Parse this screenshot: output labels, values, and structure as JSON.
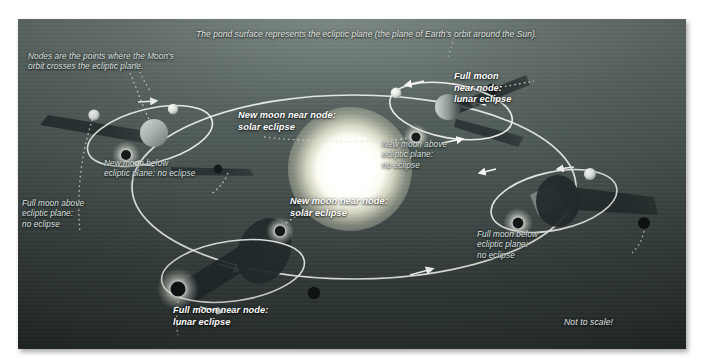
{
  "figure": {
    "not_to_scale_note": "Not to scale!",
    "top_caption": "The pond surface represents the ecliptic plane (the plane of Earth's orbit around the Sun).",
    "node_caption": "Nodes are the points where the Moon's\norbit crosses the ecliptic plane.",
    "colors": {
      "water_near": "#6e7a76",
      "water_far": "#2b3331",
      "orbit_line": "#f2f3ef",
      "dotted_guide": "#e6e8e4",
      "sun_core": "#ffffff",
      "earth_lit": "#b9c3bd",
      "earth_dark": "#1a1f1f",
      "label_text": "#e9ece9",
      "frame_border": "#ffffff"
    }
  },
  "labels": [
    {
      "id": "top-caption",
      "name": "caption-ecliptic-plane",
      "style": "caption",
      "text": "The pond surface represents the ecliptic plane (the plane of Earth's orbit around the Sun)."
    },
    {
      "id": "nodes-note",
      "name": "caption-nodes-definition",
      "style": "plain",
      "text": "Nodes are the points where the Moon's\norbit crosses the ecliptic plane."
    },
    {
      "id": "full-moon-node-lunar-top",
      "name": "label-full-moon-near-node-lunar-eclipse-top",
      "style": "bold",
      "text": "Full moon\nnear node:\nlunar eclipse"
    },
    {
      "id": "new-moon-node-solar-top",
      "name": "label-new-moon-near-node-solar-eclipse-top",
      "style": "bold",
      "text": "New moon near node:\nsolar eclipse"
    },
    {
      "id": "new-moon-above",
      "name": "label-new-moon-above-ecliptic-no-eclipse",
      "style": "plain",
      "text": "New moon above\necliptic plane:\nno eclipse"
    },
    {
      "id": "new-moon-below",
      "name": "label-new-moon-below-ecliptic-no-eclipse",
      "style": "plain",
      "text": "New moon below\necliptic plane: no eclipse"
    },
    {
      "id": "full-moon-above",
      "name": "label-full-moon-above-ecliptic-no-eclipse",
      "style": "plain",
      "text": "Full moon above\necliptic plane:\nno eclipse"
    },
    {
      "id": "new-moon-node-solar-bottom",
      "name": "label-new-moon-near-node-solar-eclipse-bottom",
      "style": "bold",
      "text": "New moon near node:\nsolar eclipse"
    },
    {
      "id": "full-moon-node-lunar-bottom",
      "name": "label-full-moon-near-node-lunar-eclipse-bottom",
      "style": "bold",
      "text": "Full moon near node:\nlunar eclipse"
    },
    {
      "id": "full-moon-below",
      "name": "label-full-moon-below-ecliptic-no-eclipse",
      "style": "plain",
      "text": "Full moon below\necliptic plane:\nno eclipse"
    },
    {
      "id": "not-to-scale",
      "name": "label-not-to-scale",
      "style": "note",
      "text": "Not to scale!"
    }
  ],
  "scene": {
    "sun": {
      "label": "sun",
      "cx": 330,
      "cy": 149,
      "radius": 33
    },
    "earth_moon_systems": [
      {
        "id": "sys-left",
        "label": "earth-moon-system-left",
        "cx": 132,
        "cy": 117
      },
      {
        "id": "sys-upper-right",
        "label": "earth-moon-system-upper-right",
        "cx": 433,
        "cy": 92
      },
      {
        "id": "sys-bottom",
        "label": "earth-moon-system-bottom",
        "cx": 215,
        "cy": 252
      },
      {
        "id": "sys-right",
        "label": "earth-moon-system-right",
        "cx": 545,
        "cy": 190
      }
    ],
    "earth_orbit": {
      "label": "earth-orbit-ellipse",
      "cx": 336,
      "cy": 168,
      "rx": 222,
      "ry": 92,
      "direction": "counterclockwise"
    }
  }
}
